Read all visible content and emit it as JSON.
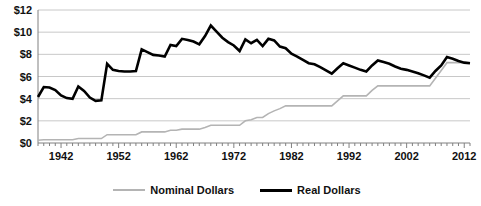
{
  "chart_data": {
    "type": "line",
    "title": "",
    "xlabel": "",
    "ylabel": "",
    "xlim": [
      1938,
      2013
    ],
    "ylim": [
      0,
      12
    ],
    "grid": true,
    "y_tick_labels": [
      "$0",
      "$2",
      "$4",
      "$6",
      "$8",
      "$10",
      "$12"
    ],
    "y_tick_values": [
      0,
      2,
      4,
      6,
      8,
      10,
      12
    ],
    "x_tick_labels": [
      "1942",
      "1952",
      "1962",
      "1972",
      "1982",
      "1992",
      "2002",
      "2012"
    ],
    "x_tick_values": [
      1942,
      1952,
      1962,
      1972,
      1982,
      1992,
      2002,
      2012
    ],
    "x_minor_tick_step": 1,
    "legend_position": "bottom-center",
    "series": [
      {
        "name": "Nominal Dollars",
        "color": "#b4b4b4",
        "width": 1.6,
        "x": [
          1938,
          1939,
          1940,
          1941,
          1942,
          1943,
          1944,
          1945,
          1946,
          1947,
          1948,
          1949,
          1950,
          1951,
          1952,
          1953,
          1954,
          1955,
          1956,
          1957,
          1958,
          1959,
          1960,
          1961,
          1962,
          1963,
          1964,
          1965,
          1966,
          1967,
          1968,
          1969,
          1970,
          1971,
          1972,
          1973,
          1974,
          1975,
          1976,
          1977,
          1978,
          1979,
          1980,
          1981,
          1982,
          1983,
          1984,
          1985,
          1986,
          1987,
          1988,
          1989,
          1990,
          1991,
          1992,
          1993,
          1994,
          1995,
          1996,
          1997,
          1998,
          1999,
          2000,
          2001,
          2002,
          2003,
          2004,
          2005,
          2006,
          2007,
          2008,
          2009,
          2010,
          2011,
          2012,
          2013
        ],
        "values": [
          0.25,
          0.3,
          0.3,
          0.3,
          0.3,
          0.3,
          0.3,
          0.4,
          0.4,
          0.4,
          0.4,
          0.4,
          0.75,
          0.75,
          0.75,
          0.75,
          0.75,
          0.75,
          1.0,
          1.0,
          1.0,
          1.0,
          1.0,
          1.15,
          1.15,
          1.25,
          1.25,
          1.25,
          1.25,
          1.4,
          1.6,
          1.6,
          1.6,
          1.6,
          1.6,
          1.6,
          2.0,
          2.1,
          2.3,
          2.3,
          2.65,
          2.9,
          3.1,
          3.35,
          3.35,
          3.35,
          3.35,
          3.35,
          3.35,
          3.35,
          3.35,
          3.35,
          3.8,
          4.25,
          4.25,
          4.25,
          4.25,
          4.25,
          4.75,
          5.15,
          5.15,
          5.15,
          5.15,
          5.15,
          5.15,
          5.15,
          5.15,
          5.15,
          5.15,
          5.85,
          6.55,
          7.25,
          7.25,
          7.25,
          7.25,
          7.25
        ]
      },
      {
        "name": "Real Dollars",
        "color": "#000000",
        "width": 2.6,
        "x": [
          1938,
          1939,
          1940,
          1941,
          1942,
          1943,
          1944,
          1945,
          1946,
          1947,
          1948,
          1949,
          1950,
          1951,
          1952,
          1953,
          1954,
          1955,
          1956,
          1957,
          1958,
          1959,
          1960,
          1961,
          1962,
          1963,
          1964,
          1965,
          1966,
          1967,
          1968,
          1969,
          1970,
          1971,
          1972,
          1973,
          1974,
          1975,
          1976,
          1977,
          1978,
          1979,
          1980,
          1981,
          1982,
          1983,
          1984,
          1985,
          1986,
          1987,
          1988,
          1989,
          1990,
          1991,
          1992,
          1993,
          1994,
          1995,
          1996,
          1997,
          1998,
          1999,
          2000,
          2001,
          2002,
          2003,
          2004,
          2005,
          2006,
          2007,
          2008,
          2009,
          2010,
          2011,
          2012,
          2013
        ],
        "values": [
          4.15,
          5.05,
          5.0,
          4.78,
          4.3,
          4.05,
          3.98,
          5.1,
          4.7,
          4.1,
          3.8,
          3.85,
          7.15,
          6.6,
          6.5,
          6.45,
          6.45,
          6.5,
          8.45,
          8.2,
          7.95,
          7.9,
          7.8,
          8.85,
          8.75,
          9.4,
          9.3,
          9.15,
          8.9,
          9.65,
          10.6,
          10.05,
          9.5,
          9.1,
          8.8,
          8.3,
          9.35,
          9.0,
          9.3,
          8.75,
          9.4,
          9.25,
          8.7,
          8.55,
          8.05,
          7.8,
          7.5,
          7.2,
          7.1,
          6.85,
          6.55,
          6.25,
          6.75,
          7.2,
          7.0,
          6.8,
          6.6,
          6.45,
          7.0,
          7.45,
          7.3,
          7.15,
          6.9,
          6.7,
          6.6,
          6.45,
          6.3,
          6.1,
          5.9,
          6.5,
          7.0,
          7.75,
          7.6,
          7.4,
          7.25,
          7.2
        ]
      }
    ]
  },
  "legend": {
    "items": [
      {
        "label": "Nominal Dollars"
      },
      {
        "label": "Real Dollars"
      }
    ]
  },
  "colors": {
    "nominal": "#b4b4b4",
    "real": "#000000",
    "grid": "#c8c8c8",
    "axis": "#808080",
    "text": "#111111",
    "background": "#ffffff"
  }
}
